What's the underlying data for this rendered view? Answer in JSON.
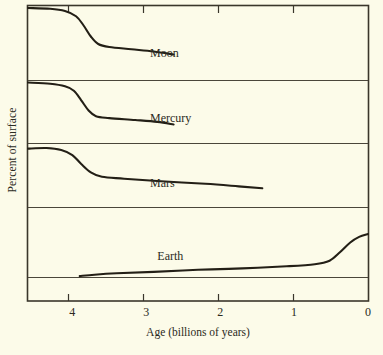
{
  "chart_data": {
    "type": "line",
    "title": "",
    "xlabel": "Age (billions of years)",
    "ylabel": "Percent of surface",
    "xlim": [
      4.6,
      0
    ],
    "ylim": [
      0,
      100
    ],
    "x_ticks": [
      4,
      3,
      2,
      1,
      0
    ],
    "x_tick_labels": [
      "4",
      "3",
      "2",
      "1",
      "0"
    ],
    "y_ticks": [],
    "y_tick_labels": [],
    "grid": "horizontal panel dividers only",
    "axis_direction": "x decreasing left to right (time before present)",
    "legend": "inline labels next to each curve",
    "line_color": "#231f16",
    "background_color": "#fcfbe9",
    "frame_color": "#3a362b",
    "series": [
      {
        "name": "Moon",
        "label": "Moon",
        "label_x": 2.95,
        "label_y_panel": "panel-1",
        "points": [
          {
            "x": 4.6,
            "y": 96
          },
          {
            "x": 4.3,
            "y": 95
          },
          {
            "x": 4.1,
            "y": 92
          },
          {
            "x": 3.95,
            "y": 85
          },
          {
            "x": 3.85,
            "y": 73
          },
          {
            "x": 3.75,
            "y": 58
          },
          {
            "x": 3.65,
            "y": 48
          },
          {
            "x": 3.5,
            "y": 44
          },
          {
            "x": 3.2,
            "y": 41
          },
          {
            "x": 2.9,
            "y": 38
          },
          {
            "x": 2.63,
            "y": 34
          }
        ]
      },
      {
        "name": "Mercury",
        "label": "Mercury",
        "label_x": 2.95,
        "label_y_panel": "panel-2",
        "points": [
          {
            "x": 4.6,
            "y": 96
          },
          {
            "x": 4.3,
            "y": 94
          },
          {
            "x": 4.1,
            "y": 90
          },
          {
            "x": 3.98,
            "y": 83
          },
          {
            "x": 3.88,
            "y": 68
          },
          {
            "x": 3.78,
            "y": 52
          },
          {
            "x": 3.68,
            "y": 43
          },
          {
            "x": 3.5,
            "y": 40
          },
          {
            "x": 3.15,
            "y": 37
          },
          {
            "x": 2.85,
            "y": 34
          },
          {
            "x": 2.63,
            "y": 30
          }
        ]
      },
      {
        "name": "Mars",
        "label": "Mars",
        "label_x": 2.95,
        "label_y_panel": "panel-3",
        "points": [
          {
            "x": 4.6,
            "y": 92
          },
          {
            "x": 4.35,
            "y": 93
          },
          {
            "x": 4.15,
            "y": 90
          },
          {
            "x": 4.0,
            "y": 82
          },
          {
            "x": 3.88,
            "y": 68
          },
          {
            "x": 3.75,
            "y": 55
          },
          {
            "x": 3.6,
            "y": 48
          },
          {
            "x": 3.3,
            "y": 45
          },
          {
            "x": 2.8,
            "y": 41
          },
          {
            "x": 2.2,
            "y": 37
          },
          {
            "x": 1.75,
            "y": 33
          },
          {
            "x": 1.43,
            "y": 30
          }
        ]
      },
      {
        "name": "Earth",
        "label": "Earth",
        "label_x": 2.85,
        "label_y_panel": "panel-4",
        "points": [
          {
            "x": 3.9,
            "y": 2
          },
          {
            "x": 3.7,
            "y": 4
          },
          {
            "x": 3.4,
            "y": 6
          },
          {
            "x": 2.9,
            "y": 8
          },
          {
            "x": 2.3,
            "y": 11
          },
          {
            "x": 1.7,
            "y": 13
          },
          {
            "x": 1.1,
            "y": 16
          },
          {
            "x": 0.72,
            "y": 19
          },
          {
            "x": 0.52,
            "y": 24
          },
          {
            "x": 0.38,
            "y": 36
          },
          {
            "x": 0.24,
            "y": 50
          },
          {
            "x": 0.12,
            "y": 58
          },
          {
            "x": 0.0,
            "y": 62
          }
        ]
      }
    ]
  }
}
